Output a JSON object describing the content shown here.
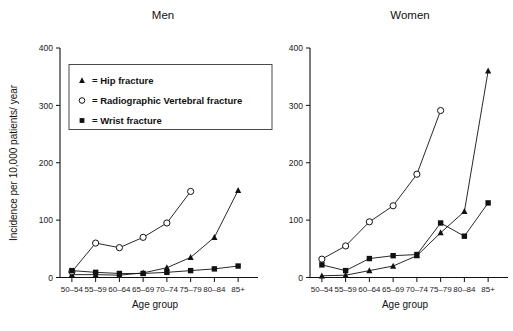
{
  "figure": {
    "ylabel": "Incidence per 10,000 patients/ year",
    "xlabel_left": "Age group",
    "xlabel_right": "Age group"
  },
  "legend": {
    "items": [
      {
        "marker": "triangle-up-filled-icon",
        "label": "= Hip fracture"
      },
      {
        "marker": "circle-open-icon",
        "label": "= Radiographic Vertebral fracture"
      },
      {
        "marker": "square-filled-icon",
        "label": "= Wrist fracture"
      }
    ]
  },
  "chart_data": [
    {
      "type": "line",
      "title": "Men",
      "xlabel": "Age group",
      "ylabel": "Incidence per 10,000 patients/ year",
      "categories": [
        "50–54",
        "55–59",
        "60–64",
        "65–69",
        "70–74",
        "75–79",
        "80–84",
        "85+"
      ],
      "ylim": [
        0,
        400
      ],
      "yticks": [
        0,
        100,
        200,
        300,
        400
      ],
      "grid": false,
      "legend_position": "upper-left-shared",
      "series": [
        {
          "name": "Hip fracture",
          "marker": "triangle",
          "values": [
            5,
            5,
            4,
            8,
            17,
            35,
            70,
            152
          ]
        },
        {
          "name": "Radiographic Vertebral fracture",
          "marker": "circle",
          "values": [
            10,
            60,
            52,
            70,
            95,
            150,
            null,
            null
          ]
        },
        {
          "name": "Wrist fracture",
          "marker": "square",
          "values": [
            12,
            9,
            7,
            7,
            9,
            12,
            15,
            20
          ]
        }
      ]
    },
    {
      "type": "line",
      "title": "Women",
      "xlabel": "Age group",
      "ylabel": "Incidence per 10,000 patients/ year",
      "categories": [
        "50–54",
        "55–59",
        "60–64",
        "65–69",
        "70–74",
        "75–79",
        "80–84",
        "85+"
      ],
      "ylim": [
        0,
        400
      ],
      "yticks": [
        0,
        100,
        200,
        300,
        400
      ],
      "grid": false,
      "legend_position": "shared-left-panel",
      "series": [
        {
          "name": "Hip fracture",
          "marker": "triangle",
          "values": [
            3,
            4,
            12,
            20,
            38,
            78,
            115,
            360
          ]
        },
        {
          "name": "Radiographic Vertebral fracture",
          "marker": "circle",
          "values": [
            32,
            55,
            97,
            125,
            180,
            291,
            null,
            null
          ]
        },
        {
          "name": "Wrist fracture",
          "marker": "square",
          "values": [
            22,
            12,
            33,
            38,
            40,
            95,
            72,
            130
          ]
        }
      ]
    }
  ]
}
